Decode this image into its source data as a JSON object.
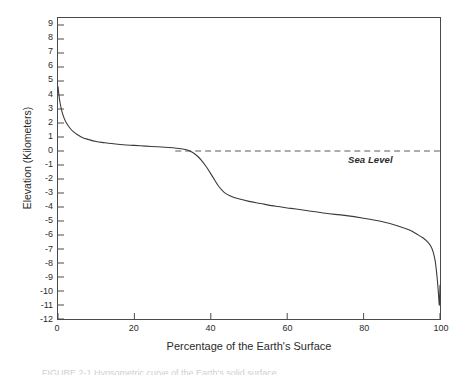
{
  "figure": {
    "background_color": "#ffffff",
    "frame_color": "#4a4a4a",
    "curve_color": "#3a3a3a",
    "caption_partial": "FIGURE 2-1  Hypsometric curve of the Earth's solid surface."
  },
  "chart_data": {
    "type": "line",
    "title": "",
    "subtitle": "",
    "xlabel": "Percentage of the Earth's Surface",
    "ylabel": "Elevation (Kilometers)",
    "xlim": [
      0,
      100
    ],
    "ylim": [
      -12,
      9.5
    ],
    "grid": false,
    "legend": null,
    "xticks": [
      0,
      20,
      40,
      60,
      80,
      100
    ],
    "xtick_labels": [
      "0",
      "20",
      "40",
      "60",
      "80",
      "100"
    ],
    "yticks": [
      9,
      8,
      7,
      6,
      5,
      4,
      3,
      2,
      1,
      0,
      -1,
      -2,
      -3,
      -4,
      -5,
      -6,
      -7,
      -8,
      -9,
      -10,
      -11,
      -12
    ],
    "ytick_labels": [
      "9",
      "8",
      "7",
      "6",
      "5",
      "4",
      "3",
      "2",
      "1",
      "0",
      "-1",
      "-2",
      "-3",
      "-4",
      "-5",
      "-6",
      "-7",
      "-8",
      "-9",
      "-10",
      "-11",
      "-12"
    ],
    "series": [
      {
        "name": "Hypsometric curve",
        "style": "solid",
        "x": [
          0.0,
          0.2,
          0.5,
          1.0,
          1.6,
          2.2,
          3.0,
          4.0,
          5.0,
          6.5,
          8.0,
          10.0,
          12.0,
          14.0,
          17.0,
          20.0,
          23.0,
          26.0,
          29.0,
          31.0,
          33.0,
          34.5,
          36.0,
          37.5,
          39.0,
          40.5,
          42.0,
          43.5,
          45.0,
          47.0,
          50.0,
          53.0,
          57.0,
          61.0,
          65.0,
          70.0,
          75.0,
          80.0,
          85.0,
          89.0,
          92.0,
          94.0,
          95.5,
          96.8,
          97.6,
          98.2,
          98.7,
          99.0,
          99.3,
          99.6,
          99.8,
          99.9,
          100.0
        ],
        "y": [
          4.6,
          4.1,
          3.5,
          2.85,
          2.35,
          2.0,
          1.68,
          1.38,
          1.18,
          0.95,
          0.82,
          0.68,
          0.6,
          0.53,
          0.45,
          0.4,
          0.35,
          0.3,
          0.25,
          0.2,
          0.12,
          0.0,
          -0.25,
          -0.65,
          -1.2,
          -1.85,
          -2.5,
          -2.95,
          -3.2,
          -3.4,
          -3.6,
          -3.75,
          -3.95,
          -4.1,
          -4.25,
          -4.45,
          -4.6,
          -4.8,
          -5.05,
          -5.35,
          -5.65,
          -5.95,
          -6.2,
          -6.5,
          -6.8,
          -7.2,
          -7.8,
          -8.4,
          -9.2,
          -10.2,
          -11.0,
          -10.6,
          -9.6
        ]
      }
    ],
    "annotations": [
      {
        "name": "sea-level-line",
        "type": "hline",
        "y": 0,
        "x_start": 30.7,
        "x_end": 100,
        "style": "dashed",
        "label": "Sea Level"
      }
    ]
  }
}
